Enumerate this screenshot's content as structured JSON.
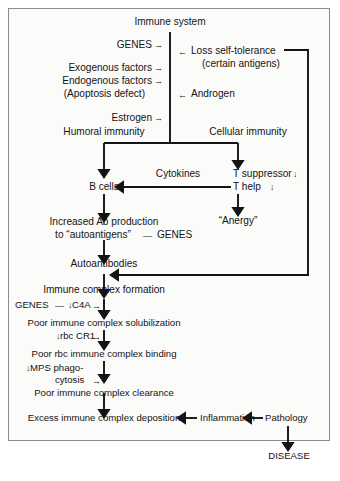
{
  "figure": {
    "frame_color": "#8c8c8c",
    "background": "#fbfbfa",
    "ink_color": "#141414"
  },
  "nodes": {
    "immune_system": "Immune system",
    "genes_top": "GENES",
    "exogenous_factors": "Exogenous factors",
    "endogenous_factors": "Endogenous factors",
    "apoptosis_defect": "(Apoptosis defect)",
    "estrogen": "Estrogen",
    "loss_self_tolerance": "Loss self-tolerance",
    "certain_antigens": "(certain antigens)",
    "androgen": "Androgen",
    "humoral_immunity": "Humoral immunity",
    "cellular_immunity": "Cellular immunity",
    "b_cells": "B cells",
    "cytokines": "Cytokines",
    "t_suppressor": "T suppressor",
    "t_help": "T help",
    "anergy": "“Anergy”",
    "increased_ab_line1": "Increased Ab production",
    "increased_ab_line2": "to “autoantigens”",
    "genes_autoantigens": "GENES",
    "autoantibodies": "Autoantibodies",
    "immune_complex_formation": "Immune complex formation",
    "genes_c4a": "GENES",
    "c4a": "C4A",
    "poor_solubilization": "Poor immune complex solubilization",
    "rbc_cr1": "rbc CR1",
    "poor_rbc_binding": "Poor rbc immune complex binding",
    "mps_phago": "MPS phago-",
    "cytosis": "cytosis",
    "poor_clearance": "Poor immune complex clearance",
    "excess_deposition": "Excess immune complex deposition",
    "inflammation": "Inflammation",
    "pathology": "Pathology",
    "disease": "DISEASE"
  },
  "symbols": {
    "arrow_right": "→",
    "arrow_left": "←",
    "arrow_down_small": "↓",
    "dash_left": "—"
  },
  "modifiers": {
    "t_suppressor_change": "↓",
    "t_help_change": "↓",
    "c4a_change": "↓",
    "rbc_cr1_change": "↓",
    "mps_change": "↓"
  }
}
